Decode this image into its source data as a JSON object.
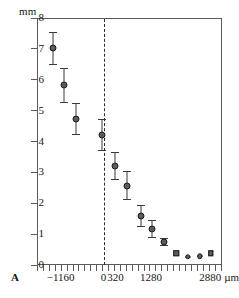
{
  "panel": {
    "label": "A"
  },
  "axes": {
    "y_unit_label": "mm",
    "x_unit_label": "µm"
  },
  "chart_data": {
    "type": "scatter",
    "title": "",
    "subtitle": "",
    "xlabel": "µm",
    "ylabel": "mm",
    "panel_label": "A",
    "grid": false,
    "legend": "none",
    "xlim": [
      -1800,
      3200
    ],
    "ylim": [
      0,
      8
    ],
    "y_ticks": [
      0,
      1,
      2,
      3,
      4,
      5,
      6,
      7,
      8
    ],
    "y_tick_labels": [
      "0",
      "1",
      "2",
      "3",
      "4",
      "5",
      "6",
      "7",
      "8"
    ],
    "x_ticks": [
      -1800,
      -1640,
      -1480,
      -1320,
      -1160,
      -1000,
      -840,
      -680,
      -520,
      -360,
      -200,
      -40,
      120,
      280,
      440,
      600,
      760,
      920,
      1080,
      1240,
      1400,
      1560,
      1720,
      1880,
      2040,
      2200,
      2360,
      2520,
      2680,
      2840,
      3000,
      3160
    ],
    "x_labeled_ticks": [
      {
        "value": -1160,
        "label": "−1160"
      },
      {
        "value": 0,
        "label": "0"
      },
      {
        "value": 320,
        "label": "320"
      },
      {
        "value": 1280,
        "label": "1280"
      },
      {
        "value": 2880,
        "label": "2880"
      }
    ],
    "reference_line": {
      "x": 0,
      "style": "dashed",
      "color": "#2b2b2b"
    },
    "marker_color": "#5b5b5b",
    "marker_edge_color": "#1c1c1c",
    "errorbar_color": "#3a3a3a",
    "series": [
      {
        "name": "mean displacement",
        "points": [
          {
            "x": -1380,
            "y": 7.02,
            "err_low": 0.52,
            "err_high": 0.52,
            "marker": "circle"
          },
          {
            "x": -1060,
            "y": 5.82,
            "err_low": 0.55,
            "err_high": 0.55,
            "marker": "circle"
          },
          {
            "x": -740,
            "y": 4.74,
            "err_low": 0.5,
            "err_high": 0.5,
            "marker": "circle"
          },
          {
            "x": -40,
            "y": 4.2,
            "err_low": 0.48,
            "err_high": 0.52,
            "marker": "circle"
          },
          {
            "x": 300,
            "y": 3.22,
            "err_low": 0.45,
            "err_high": 0.42,
            "marker": "circle"
          },
          {
            "x": 620,
            "y": 2.57,
            "err_low": 0.44,
            "err_high": 0.45,
            "marker": "circle"
          },
          {
            "x": 1000,
            "y": 1.6,
            "err_low": 0.36,
            "err_high": 0.33,
            "marker": "circle"
          },
          {
            "x": 1300,
            "y": 1.16,
            "err_low": 0.27,
            "err_high": 0.28,
            "marker": "circle"
          },
          {
            "x": 1620,
            "y": 0.74,
            "err_low": 0.11,
            "err_high": 0.12,
            "marker": "circle"
          },
          {
            "x": 1960,
            "y": 0.38,
            "err_low": 0.05,
            "err_high": 0.05,
            "marker": "square"
          },
          {
            "x": 2280,
            "y": 0.26,
            "err_low": 0.03,
            "err_high": 0.03,
            "marker": "circle"
          },
          {
            "x": 2600,
            "y": 0.29,
            "err_low": 0.03,
            "err_high": 0.03,
            "marker": "circle"
          },
          {
            "x": 2900,
            "y": 0.38,
            "err_low": 0.05,
            "err_high": 0.05,
            "marker": "square"
          }
        ]
      }
    ]
  }
}
